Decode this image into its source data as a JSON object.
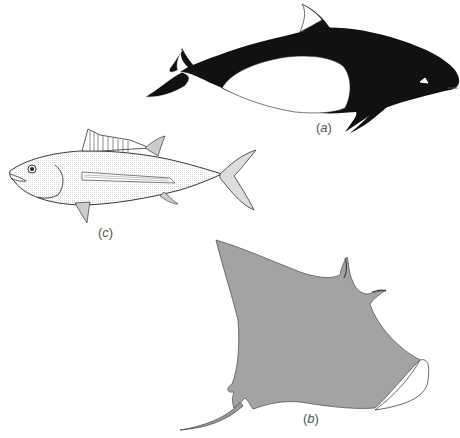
{
  "figure": {
    "animals": [
      {
        "id": "a",
        "name": "dolphin",
        "label": "(a)",
        "label_letter": "a"
      },
      {
        "id": "b",
        "name": "manta-ray",
        "label": "(b)",
        "label_letter": "b"
      },
      {
        "id": "c",
        "name": "tuna",
        "label": "(c)",
        "label_letter": "c"
      }
    ],
    "colors": {
      "dolphin_body": "#111111",
      "ray_body": "#a3a3a3",
      "outline": "#222222",
      "background": "#ffffff"
    }
  },
  "labels": {
    "a_open": "(",
    "a_letter": "a",
    "a_close": ")",
    "b_open": "(",
    "b_letter": "b",
    "b_close": ")",
    "c_open": "(",
    "c_letter": "c",
    "c_close": ")"
  }
}
